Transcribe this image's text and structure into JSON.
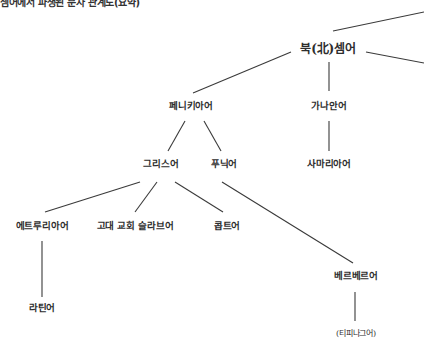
{
  "caption": "셈어에서 파생된 문자 관계도(요약)",
  "nodes": {
    "north_semitic": "북(北)셈어",
    "phoenician": "페니키아어",
    "canaanite": "가나안어",
    "greek": "그리스어",
    "punic": "푸닉어",
    "samaritan": "사마리아어",
    "etruscan": "에트루리아어",
    "old_church_slavonic": "고대 교회 슬라브어",
    "coptic": "콥트어",
    "berber": "베르베르어",
    "latin": "라틴어",
    "tifinagh": "(티피나그어)"
  },
  "edges": [
    [
      "north_semitic",
      "offscreen-upper-right"
    ],
    [
      "north_semitic",
      "offscreen-right"
    ],
    [
      "north_semitic",
      "phoenician"
    ],
    [
      "north_semitic",
      "canaanite"
    ],
    [
      "phoenician",
      "greek"
    ],
    [
      "phoenician",
      "punic"
    ],
    [
      "canaanite",
      "samaritan"
    ],
    [
      "greek",
      "etruscan"
    ],
    [
      "greek",
      "old_church_slavonic"
    ],
    [
      "greek",
      "coptic"
    ],
    [
      "punic",
      "berber"
    ],
    [
      "etruscan",
      "latin"
    ],
    [
      "berber",
      "tifinagh"
    ]
  ]
}
